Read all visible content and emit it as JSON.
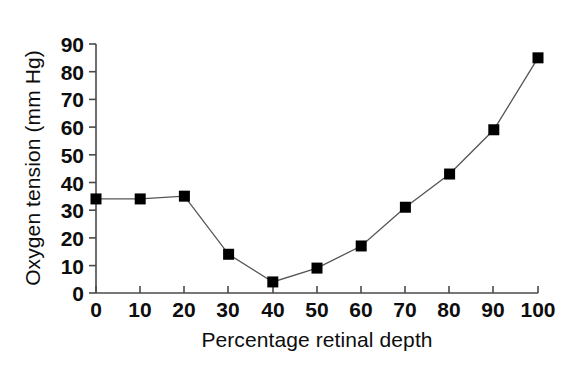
{
  "chart_data": {
    "type": "line",
    "title": "",
    "xlabel": "Percentage retinal depth",
    "ylabel": "Oxygen tension (mm Hg)",
    "xlim": [
      0,
      100
    ],
    "ylim": [
      0,
      90
    ],
    "xticks": [
      0,
      10,
      20,
      30,
      40,
      50,
      60,
      70,
      80,
      90,
      100
    ],
    "yticks": [
      0,
      10,
      20,
      30,
      40,
      50,
      60,
      70,
      80,
      90
    ],
    "xtick_labels": [
      "0",
      "10",
      "20",
      "30",
      "40",
      "50",
      "60",
      "70",
      "80",
      "90",
      "100"
    ],
    "ytick_labels": [
      "0",
      "10",
      "20",
      "30",
      "40",
      "50",
      "60",
      "70",
      "80",
      "90"
    ],
    "grid": false,
    "legend": false,
    "legend_position": "none",
    "marker": "square",
    "marker_color": "#000000",
    "line_color": "#555555",
    "x": [
      0,
      10,
      20,
      30,
      40,
      50,
      60,
      70,
      80,
      90,
      100
    ],
    "values": [
      34,
      34,
      35,
      14,
      4,
      9,
      17,
      31,
      43,
      59,
      85
    ],
    "series": [
      {
        "name": "Oxygen tension",
        "x": [
          0,
          10,
          20,
          30,
          40,
          50,
          60,
          70,
          80,
          90,
          100
        ],
        "values": [
          34,
          34,
          35,
          14,
          4,
          9,
          17,
          31,
          43,
          59,
          85
        ]
      }
    ]
  },
  "axes": {
    "y_title": "Oxygen tension (mm Hg)",
    "x_title": "Percentage retinal depth"
  },
  "ytick_text": {
    "t0": "0",
    "t1": "10",
    "t2": "20",
    "t3": "30",
    "t4": "40",
    "t5": "50",
    "t6": "60",
    "t7": "70",
    "t8": "80",
    "t9": "90"
  },
  "xtick_text": {
    "t0": "0",
    "t1": "10",
    "t2": "20",
    "t3": "30",
    "t4": "40",
    "t5": "50",
    "t6": "60",
    "t7": "70",
    "t8": "80",
    "t9": "90",
    "t10": "100"
  }
}
